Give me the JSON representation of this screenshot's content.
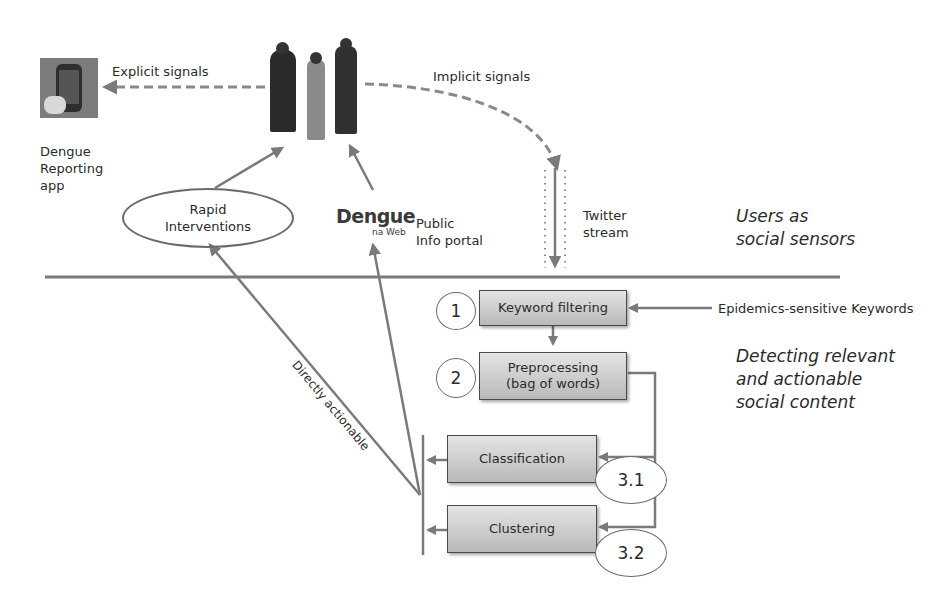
{
  "diagram": {
    "top_section": {
      "title": "Users as social sensors",
      "title_lines": [
        "Users as",
        "social sensors"
      ],
      "app": {
        "label_lines": [
          "Dengue",
          "Reporting",
          "app"
        ],
        "icon": "smartphone-app-icon"
      },
      "people_icon": "people-group-icon",
      "explicit_signals": "Explicit signals",
      "implicit_signals": "Implicit signals",
      "rapid_interventions_lines": [
        "Rapid",
        "Interventions"
      ],
      "portal": {
        "logo_main": "Dengue",
        "logo_sub": "na Web",
        "label_lines": [
          "Public",
          "Info portal"
        ]
      },
      "twitter_stream_lines": [
        "Twitter",
        "stream"
      ]
    },
    "bottom_section": {
      "title_lines": [
        "Detecting relevant",
        "and actionable",
        "social content"
      ],
      "steps": [
        {
          "number": "1",
          "label_lines": [
            "Keyword filtering"
          ]
        },
        {
          "number": "2",
          "label_lines": [
            "Preprocessing",
            "(bag of words)"
          ]
        },
        {
          "number": "3.1",
          "label_lines": [
            "Classification"
          ]
        },
        {
          "number": "3.2",
          "label_lines": [
            "Clustering"
          ]
        }
      ],
      "keywords_input": "Epidemics-sensitive Keywords",
      "directly_actionable": "Directly actionable"
    },
    "colors": {
      "line": "#7a7a7a",
      "box_top": "#e4e4e4",
      "box_bottom": "#b9b9b9",
      "text": "#2b2b2b"
    }
  }
}
